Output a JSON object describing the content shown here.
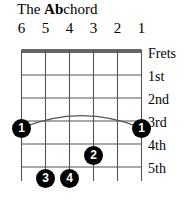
{
  "title": {
    "prefix": "The ",
    "root": "Ab",
    "suffix": "chord",
    "full": "The Ab chord"
  },
  "instrument": "guitar",
  "diagram_type": "chord-diagram",
  "colors": {
    "background": "#ffffff",
    "grid": "#555555",
    "nut": "#333333",
    "dot_fill": "#000000",
    "dot_text": "#ffffff",
    "text": "#000000"
  },
  "strings": {
    "count": 6,
    "labels": [
      "6",
      "5",
      "4",
      "3",
      "2",
      "1"
    ],
    "x": [
      21.5,
      45.5,
      69.5,
      93.5,
      117.5,
      141.5
    ]
  },
  "frets": {
    "count": 5,
    "labels": [
      "Frets",
      "1st",
      "2nd",
      "3rd",
      "4th",
      "5th"
    ],
    "label_y": [
      46,
      69,
      92,
      115,
      138,
      161
    ],
    "line_y": [
      50,
      52,
      75,
      98,
      121,
      144,
      167
    ],
    "string_bottom_y": 181
  },
  "barre": {
    "finger": "1",
    "fret": 4,
    "from_string": 6,
    "to_string": 1,
    "arc_peak_y": 112,
    "arc_end_y": 128
  },
  "fingerings": [
    {
      "label": "1",
      "string": 6,
      "fret": 4,
      "x": 21.5,
      "y": 128
    },
    {
      "label": "1",
      "string": 1,
      "fret": 4,
      "x": 141.5,
      "y": 128
    },
    {
      "label": "2",
      "string": 3,
      "fret": 5,
      "x": 93.5,
      "y": 155
    },
    {
      "label": "3",
      "string": 5,
      "fret": 6,
      "x": 45.5,
      "y": 178
    },
    {
      "label": "4",
      "string": 4,
      "fret": 6,
      "x": 69.5,
      "y": 178
    }
  ]
}
